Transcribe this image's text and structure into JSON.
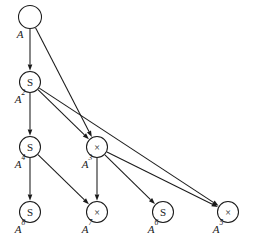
{
  "figure": {
    "background_color": "#ffffff",
    "ink_color": "#1a1a1a"
  },
  "chart_data": {
    "type": "diagram",
    "diagram_kind": "directed-acyclic-graph",
    "nodes": [
      {
        "id": "n1",
        "glyph": "",
        "label_base": "A",
        "label_exp": "",
        "cx": 30,
        "cy": 17,
        "r": 11.5
      },
      {
        "id": "n2",
        "glyph": "S",
        "label_base": "A",
        "label_exp": "2",
        "cx": 30,
        "cy": 82,
        "r": 10.5
      },
      {
        "id": "n4",
        "glyph": "S",
        "label_base": "A",
        "label_exp": "4",
        "cx": 30,
        "cy": 147,
        "r": 10.5
      },
      {
        "id": "n3",
        "glyph": "×",
        "label_base": "A",
        "label_exp": "3",
        "cx": 97,
        "cy": 147,
        "r": 10.5
      },
      {
        "id": "n8",
        "glyph": "S",
        "label_base": "A",
        "label_exp": "8",
        "cx": 30,
        "cy": 212,
        "r": 10.5
      },
      {
        "id": "n7",
        "glyph": "×",
        "label_base": "A",
        "label_exp": "7",
        "cx": 97,
        "cy": 212,
        "r": 10.5
      },
      {
        "id": "n6",
        "glyph": "S",
        "label_base": "A",
        "label_exp": "6",
        "cx": 163,
        "cy": 212,
        "r": 10.5
      },
      {
        "id": "n5",
        "glyph": "×",
        "label_base": "A",
        "label_exp": "5",
        "cx": 228,
        "cy": 212,
        "r": 10.5
      }
    ],
    "edges": [
      {
        "from": "n1",
        "to": "n2"
      },
      {
        "from": "n1",
        "to": "n3"
      },
      {
        "from": "n2",
        "to": "n4"
      },
      {
        "from": "n2",
        "to": "n3"
      },
      {
        "from": "n2",
        "to": "n5"
      },
      {
        "from": "n4",
        "to": "n8"
      },
      {
        "from": "n4",
        "to": "n7"
      },
      {
        "from": "n3",
        "to": "n7"
      },
      {
        "from": "n3",
        "to": "n6"
      },
      {
        "from": "n3",
        "to": "n5"
      }
    ],
    "node_glyph_legend": {
      "S": "squaring operation",
      "×": "multiplication operation",
      "": "input value"
    }
  }
}
